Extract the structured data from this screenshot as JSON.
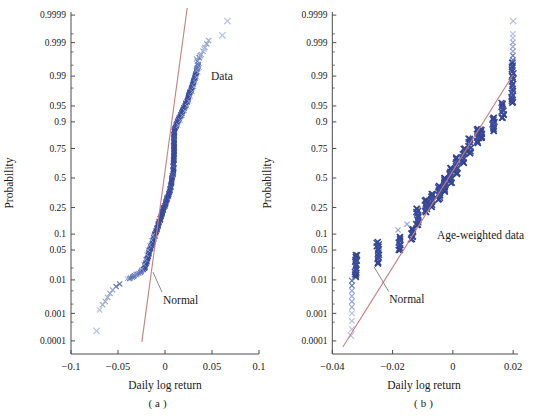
{
  "page": {
    "background": "#ffffff"
  },
  "colors": {
    "navy": "#3A4C9C",
    "navy_dark": "#33438F",
    "navy_alt": "#4A5CAF",
    "medium": "#6678BC",
    "light": "#98A7D6",
    "xlight": "#B6C1E5",
    "red_line": "#C87E7E",
    "axis": "#4D4D4D",
    "text": "#1A1A1A",
    "pointer": "#7A7A7A"
  },
  "chart_data": [
    {
      "id": "a",
      "type": "scatter",
      "plot_kind": "normal-probability-plot",
      "title": "",
      "xlabel": "Daily log return",
      "ylabel": "Probability",
      "caption": "(a)",
      "xlim": [
        -0.1,
        0.1
      ],
      "grid": false,
      "xticks": [
        {
          "label": "−0.1",
          "value": -0.1
        },
        {
          "label": "−0.05",
          "value": -0.05
        },
        {
          "label": "0",
          "value": 0
        },
        {
          "label": "0.05",
          "value": 0.05
        },
        {
          "label": "0.1",
          "value": 0.1
        }
      ],
      "yticks": [
        {
          "label": "0.9999",
          "p": 0.9999
        },
        {
          "label": "0.999",
          "p": 0.999
        },
        {
          "label": "0.99",
          "p": 0.99
        },
        {
          "label": "0.95",
          "p": 0.95
        },
        {
          "label": "0.9",
          "p": 0.9
        },
        {
          "label": "0.75",
          "p": 0.75
        },
        {
          "label": "0.5",
          "p": 0.5
        },
        {
          "label": "0.25",
          "p": 0.25
        },
        {
          "label": "0.1",
          "p": 0.1
        },
        {
          "label": "0.05",
          "p": 0.05
        },
        {
          "label": "0.01",
          "p": 0.01
        },
        {
          "label": "0.001",
          "p": 0.001
        },
        {
          "label": "0.0001",
          "p": 0.0001
        }
      ],
      "yticks_minor": [
        0.98,
        0.995,
        0.998,
        0.9995,
        0.02,
        0.005,
        0.002,
        0.0005
      ],
      "series": [
        {
          "name": "Data",
          "marker": "x",
          "kind": "quantile-band",
          "band_probit_range": [
            -2.3,
            2.6
          ],
          "quantiles": {
            "probit": [
              -3.49,
              -3.01,
              -2.9,
              -2.79,
              -2.7,
              -2.62,
              -2.56,
              -2.48,
              -2.42,
              -2.33,
              -2.25,
              -2.15,
              -2.055,
              -1.644,
              -1.187,
              -0.731,
              -0.274,
              0.144,
              0.674,
              1.096,
              1.4,
              1.644,
              1.9,
              2.1,
              2.4,
              2.626,
              2.75,
              2.95,
              3.15,
              3.26,
              3.58
            ],
            "x": [
              -0.0728,
              -0.0696,
              -0.0664,
              -0.0635,
              -0.061,
              -0.0585,
              -0.0557,
              -0.052,
              -0.0482,
              -0.0405,
              -0.034,
              -0.026,
              -0.0214,
              -0.0161,
              -0.0089,
              -0.0018,
              0.0054,
              0.0089,
              0.0094,
              0.0098,
              0.016,
              0.0215,
              0.026,
              0.029,
              0.033,
              0.036,
              0.038,
              0.043,
              0.047,
              0.061,
              0.0664
            ]
          },
          "tail_points": [
            {
              "x": -0.0482,
              "p": 0.0078,
              "shade": "medium"
            },
            {
              "x": -0.052,
              "p": 0.0066,
              "shade": "medium"
            },
            {
              "x": -0.0557,
              "p": 0.0053,
              "shade": "light"
            },
            {
              "x": -0.0585,
              "p": 0.0042,
              "shade": "light"
            },
            {
              "x": -0.061,
              "p": 0.0032,
              "shade": "light"
            },
            {
              "x": -0.0635,
              "p": 0.0024,
              "shade": "light"
            },
            {
              "x": -0.0664,
              "p": 0.0019,
              "shade": "light"
            },
            {
              "x": -0.0696,
              "p": 0.0013,
              "shade": "xlight"
            },
            {
              "x": -0.0728,
              "p": 0.00024,
              "shade": "xlight",
              "isolated": true
            },
            {
              "x": 0.0345,
              "p": 0.9962,
              "shade": "medium"
            },
            {
              "x": 0.0365,
              "p": 0.997,
              "shade": "medium"
            },
            {
              "x": 0.0385,
              "p": 0.9976,
              "shade": "light"
            },
            {
              "x": 0.0405,
              "p": 0.9981,
              "shade": "light"
            },
            {
              "x": 0.0425,
              "p": 0.99855,
              "shade": "light"
            },
            {
              "x": 0.0445,
              "p": 0.9989,
              "shade": "light"
            },
            {
              "x": 0.0465,
              "p": 0.99915,
              "shade": "light"
            },
            {
              "x": 0.0335,
              "p": 0.9967,
              "shade": "light"
            },
            {
              "x": 0.0375,
              "p": 0.9974,
              "shade": "light"
            },
            {
              "x": 0.0415,
              "p": 0.9984,
              "shade": "xlight"
            },
            {
              "x": 0.061,
              "p": 0.99944,
              "shade": "xlight",
              "isolated": true
            },
            {
              "x": 0.0664,
              "p": 0.99983,
              "shade": "xlight",
              "isolated": true
            }
          ]
        },
        {
          "name": "Normal",
          "kind": "fit-line",
          "x1": -0.0246,
          "p1": 9.2e-05,
          "x2": 0.0236,
          "p2": 0.999948
        }
      ],
      "annotations": [
        {
          "text": "Data",
          "x": 0.049,
          "p": 0.99
        },
        {
          "text": "Normal",
          "x": -0.0021,
          "p": 0.0026,
          "pointer": {
            "x1": -0.0128,
            "p1": 0.0159,
            "x2": -0.0032,
            "p2": 0.0046
          }
        }
      ]
    },
    {
      "id": "b",
      "type": "scatter",
      "plot_kind": "normal-probability-plot",
      "title": "",
      "xlabel": "Daily log return",
      "ylabel": "Probability",
      "caption": "(b)",
      "xlim": [
        -0.04,
        0.0216
      ],
      "grid": false,
      "xticks": [
        {
          "label": "−0.04",
          "value": -0.04
        },
        {
          "label": "−0.02",
          "value": -0.02
        },
        {
          "label": "0",
          "value": 0
        },
        {
          "label": "0.02",
          "value": 0.02
        }
      ],
      "yticks": [
        {
          "label": "0.9999",
          "p": 0.9999
        },
        {
          "label": "0.999",
          "p": 0.999
        },
        {
          "label": "0.99",
          "p": 0.99
        },
        {
          "label": "0.95",
          "p": 0.95
        },
        {
          "label": "0.9",
          "p": 0.9
        },
        {
          "label": "0.75",
          "p": 0.75
        },
        {
          "label": "0.5",
          "p": 0.5
        },
        {
          "label": "0.25",
          "p": 0.25
        },
        {
          "label": "0.1",
          "p": 0.1
        },
        {
          "label": "0.05",
          "p": 0.05
        },
        {
          "label": "0.01",
          "p": 0.01
        },
        {
          "label": "0.001",
          "p": 0.001
        },
        {
          "label": "0.0001",
          "p": 0.0001
        }
      ],
      "yticks_minor": [
        0.98,
        0.995,
        0.998,
        0.9995,
        0.02,
        0.005,
        0.002,
        0.0005
      ],
      "series": [
        {
          "name": "Age-weighted data",
          "marker": "x",
          "kind": "cluster-scatter",
          "clusters": [
            {
              "x": -0.0322,
              "p1": 0.012,
              "p2": 0.039,
              "n": 16
            },
            {
              "x": -0.0249,
              "p1": 0.026,
              "p2": 0.072,
              "n": 13
            },
            {
              "x": -0.0176,
              "p1": 0.05,
              "p2": 0.089,
              "n": 10
            },
            {
              "x": -0.0136,
              "p1": 0.082,
              "p2": 0.122,
              "n": 8
            },
            {
              "x": -0.0119,
              "p1": 0.142,
              "p2": 0.24,
              "n": 12
            },
            {
              "x": -0.0089,
              "p1": 0.219,
              "p2": 0.308,
              "n": 10
            },
            {
              "x": -0.007,
              "p1": 0.254,
              "p2": 0.357,
              "n": 10
            },
            {
              "x": -0.0046,
              "p1": 0.316,
              "p2": 0.428,
              "n": 10
            },
            {
              "x": -0.0027,
              "p1": 0.383,
              "p2": 0.5,
              "n": 10
            },
            {
              "x": -0.0007,
              "p1": 0.455,
              "p2": 0.59,
              "n": 11
            },
            {
              "x": 0.0013,
              "p1": 0.536,
              "p2": 0.676,
              "n": 11
            },
            {
              "x": 0.0036,
              "p1": 0.634,
              "p2": 0.746,
              "n": 10
            },
            {
              "x": 0.0056,
              "p1": 0.716,
              "p2": 0.813,
              "n": 10
            },
            {
              "x": 0.0083,
              "p1": 0.788,
              "p2": 0.868,
              "n": 11
            },
            {
              "x": 0.0095,
              "p1": 0.82,
              "p2": 0.862,
              "n": 8
            },
            {
              "x": 0.0135,
              "p1": 0.86,
              "p2": 0.915,
              "n": 10
            },
            {
              "x": 0.0165,
              "p1": 0.916,
              "p2": 0.955,
              "n": 9
            },
            {
              "x": 0.0197,
              "p1": 0.957,
              "p2": 0.9957,
              "n": 20
            }
          ],
          "tail_points": [
            {
              "x": -0.0335,
              "p": 0.0095,
              "shade": "medium"
            },
            {
              "x": -0.0335,
              "p": 0.007,
              "shade": "medium"
            },
            {
              "x": -0.0335,
              "p": 0.005,
              "shade": "light"
            },
            {
              "x": -0.0335,
              "p": 0.0035,
              "shade": "light"
            },
            {
              "x": -0.0335,
              "p": 0.0024,
              "shade": "light"
            },
            {
              "x": -0.0335,
              "p": 0.0016,
              "shade": "light"
            },
            {
              "x": -0.0335,
              "p": 0.001,
              "shade": "xlight"
            },
            {
              "x": -0.0335,
              "p": 0.00055,
              "shade": "xlight"
            },
            {
              "x": -0.0335,
              "p": 0.00028,
              "shade": "xlight"
            },
            {
              "x": -0.0338,
              "p": 0.00016,
              "shade": "xlight",
              "isolated": true
            },
            {
              "x": 0.0199,
              "p": 0.9965,
              "shade": "medium"
            },
            {
              "x": 0.0199,
              "p": 0.9974,
              "shade": "medium"
            },
            {
              "x": 0.0199,
              "p": 0.9981,
              "shade": "light"
            },
            {
              "x": 0.0199,
              "p": 0.99865,
              "shade": "light"
            },
            {
              "x": 0.0199,
              "p": 0.99903,
              "shade": "light"
            },
            {
              "x": 0.0199,
              "p": 0.99931,
              "shade": "xlight"
            },
            {
              "x": 0.0199,
              "p": 0.9995,
              "shade": "xlight"
            },
            {
              "x": 0.02,
              "p": 0.99983,
              "shade": "xlight",
              "isolated": true
            }
          ],
          "stray_points": [
            {
              "x": -0.0182,
              "p": 0.118,
              "shade": "light"
            },
            {
              "x": -0.0152,
              "p": 0.146,
              "shade": "light"
            }
          ]
        },
        {
          "name": "Normal",
          "kind": "fit-line",
          "x1": -0.0365,
          "p1": 5.7e-05,
          "x2": 0.0199,
          "p2": 0.9907
        }
      ],
      "annotations": [
        {
          "text": "Age-weighted data",
          "x": -0.0053,
          "p": 0.094
        },
        {
          "text": "Normal",
          "x": -0.0211,
          "p": 0.00275,
          "pointer": {
            "x1": -0.0262,
            "p1": 0.0215,
            "x2": -0.0213,
            "p2": 0.0048
          }
        }
      ]
    }
  ]
}
